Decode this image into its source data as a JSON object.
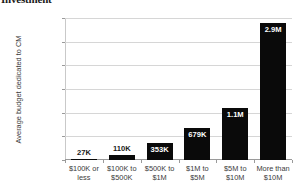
{
  "chart_data": {
    "type": "bar",
    "title": "Investment",
    "xlabel": "",
    "ylabel": "Average budget dedicated to CM",
    "categories": [
      "$100K or less",
      "$100K to $500K",
      "$500K to $1M",
      "$1M to $5M",
      "$5M to $10M",
      "More than $10M"
    ],
    "category_lines": [
      [
        "$100K or",
        "less"
      ],
      [
        "$100K to",
        "$500K"
      ],
      [
        "$500K to",
        "$1M"
      ],
      [
        "$1M to",
        "$5M"
      ],
      [
        "$5M to",
        "$10M"
      ],
      [
        "More than",
        "$10M"
      ]
    ],
    "values": [
      27000,
      110000,
      353000,
      679000,
      1100000,
      2900000
    ],
    "data_labels": [
      "27K",
      "110K",
      "353K",
      "679K",
      "1.1M",
      "2.9M"
    ],
    "ylim": [
      0,
      3000000
    ],
    "ytick_values": [
      0,
      500000,
      1000000,
      1500000,
      2000000,
      2500000,
      3000000
    ],
    "ytick_labels": [
      "$0",
      "$500,000",
      "$1,000,000",
      "$1,500,000",
      "$2,000,000",
      "$2,500,000",
      "$3,000,000"
    ],
    "grid": true,
    "legend": "none",
    "bar_color": "#0a0a0a",
    "gridline_color": "#d6d6d6",
    "axis_color": "#9a9a9a",
    "background_color": "#ffffff"
  }
}
